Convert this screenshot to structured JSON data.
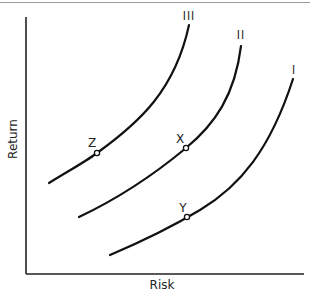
{
  "chart_data": {
    "type": "line",
    "title": "",
    "xlabel": "Risk",
    "ylabel": "Return",
    "grid": false,
    "legend": "none",
    "axis_ticks": "none",
    "series": [
      {
        "name": "I",
        "label_pos": [
          294,
          70
        ],
        "path": "M110,255 C150,238 180,222 200,210 C240,186 270,150 293,79"
      },
      {
        "name": "II",
        "label_pos": [
          240,
          35
        ],
        "path": "M79,217 C115,200 150,178 186,148 C215,124 235,95 241,46"
      },
      {
        "name": "III",
        "label_pos": [
          189,
          16
        ],
        "path": "M49,183 C70,170 85,162 97,153 C140,122 175,90 189,25"
      }
    ],
    "points": [
      {
        "name": "Z",
        "curve": "III",
        "x": 97,
        "y": 153,
        "label_pos": [
          92,
          146
        ]
      },
      {
        "name": "X",
        "curve": "II",
        "x": 186,
        "y": 148,
        "label_pos": [
          180,
          142
        ]
      },
      {
        "name": "Y",
        "curve": "I",
        "x": 187,
        "y": 217,
        "label_pos": [
          183,
          211
        ]
      }
    ]
  },
  "labels": {
    "x_axis": "Risk",
    "y_axis": "Return",
    "curve_I": "I",
    "curve_II": "II",
    "curve_III": "III",
    "point_Z": "Z",
    "point_X": "X",
    "point_Y": "Y"
  }
}
